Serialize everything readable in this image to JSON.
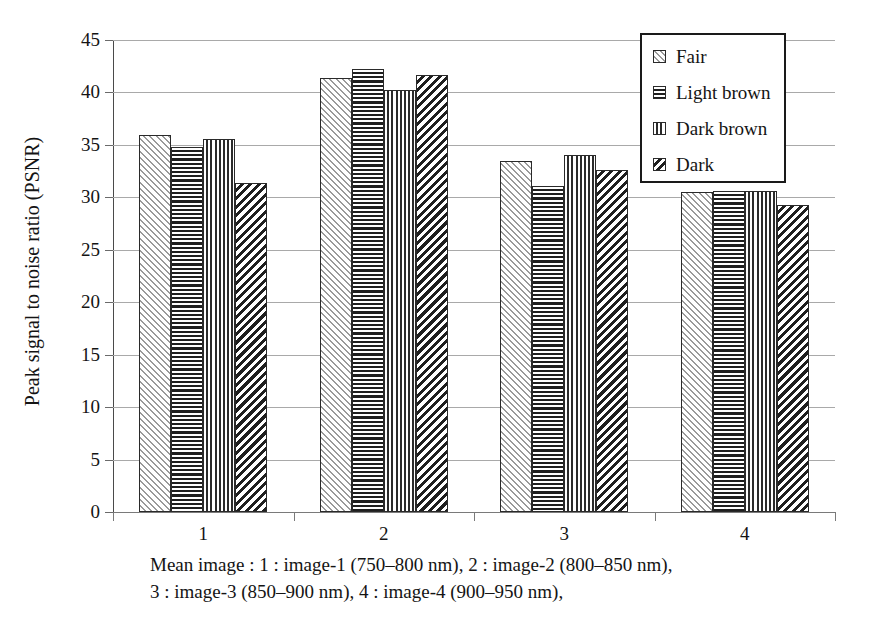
{
  "chart_data": {
    "type": "bar",
    "title": "",
    "xlabel": "",
    "ylabel": "Peak signal to noise ratio (PSNR)",
    "categories": [
      "1",
      "2",
      "3",
      "4"
    ],
    "ylim": [
      0,
      45
    ],
    "ytick_step": 5,
    "yticks": [
      "45",
      "40",
      "35",
      "30",
      "25",
      "20",
      "15",
      "10",
      "5",
      "0"
    ],
    "grid": "horizontal",
    "legend_position": "top-right",
    "series": [
      {
        "name": "Fair",
        "pattern": "diagonal-forward-light",
        "values": [
          35.9,
          41.4,
          33.5,
          30.5
        ]
      },
      {
        "name": "Light brown",
        "pattern": "horizontal-lines",
        "values": [
          34.8,
          42.2,
          31.1,
          30.6
        ]
      },
      {
        "name": "Dark brown",
        "pattern": "vertical-lines",
        "values": [
          35.6,
          40.2,
          34.0,
          30.6
        ]
      },
      {
        "name": "Dark",
        "pattern": "diagonal-backward-dense",
        "values": [
          31.4,
          41.7,
          32.6,
          29.3
        ]
      }
    ],
    "caption_lines": [
      "Mean image : 1 : image-1 (750–800 nm), 2 : image-2 (800–850 nm),",
      "3 : image-3 (850–900 nm), 4 : image-4 (900–950 nm),"
    ]
  },
  "colors": {
    "axis": "#4a4a4a",
    "grid": "#a9a9a9",
    "bar_outline": "#2a2a2a",
    "text": "#141414",
    "background": "#ffffff"
  }
}
